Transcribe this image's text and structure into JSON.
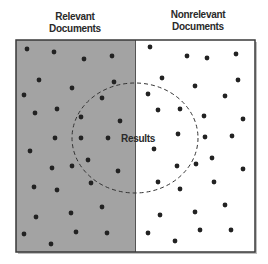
{
  "labels": {
    "relevant": {
      "line1": "Relevant",
      "line2": "Documents"
    },
    "nonrelevant": {
      "line1": "Nonrelevant",
      "line2": "Documents"
    },
    "results": "Results"
  },
  "colors": {
    "relevant_fill": "#a3a3a3",
    "nonrelevant_fill": "#ffffff",
    "border": "#3a3a3a",
    "dot": "#222222",
    "circle_stroke": "#333333"
  },
  "diagram": {
    "box": {
      "x": 16,
      "y": 40,
      "width": 239,
      "height": 212
    },
    "divider_x": 135,
    "results_ellipse": {
      "cx": 135,
      "cy": 138,
      "rx": 63,
      "ry": 55
    },
    "relevant_dots": [
      [
        27,
        49
      ],
      [
        54,
        52
      ],
      [
        84,
        59
      ],
      [
        112,
        56
      ],
      [
        39,
        80
      ],
      [
        72,
        88
      ],
      [
        114,
        82
      ],
      [
        24,
        95
      ],
      [
        102,
        98
      ],
      [
        35,
        113
      ],
      [
        57,
        109
      ],
      [
        81,
        117
      ],
      [
        120,
        121
      ],
      [
        55,
        138
      ],
      [
        81,
        138
      ],
      [
        108,
        138
      ],
      [
        30,
        151
      ],
      [
        88,
        160
      ],
      [
        52,
        168
      ],
      [
        72,
        166
      ],
      [
        118,
        171
      ],
      [
        34,
        187
      ],
      [
        57,
        190
      ],
      [
        91,
        183
      ],
      [
        102,
        207
      ],
      [
        36,
        217
      ],
      [
        71,
        213
      ],
      [
        76,
        232
      ],
      [
        107,
        233
      ],
      [
        24,
        234
      ],
      [
        51,
        244
      ]
    ],
    "nonrelevant_dots": [
      [
        150,
        47
      ],
      [
        187,
        56
      ],
      [
        207,
        58
      ],
      [
        236,
        54
      ],
      [
        162,
        78
      ],
      [
        195,
        86
      ],
      [
        238,
        80
      ],
      [
        148,
        94
      ],
      [
        225,
        96
      ],
      [
        158,
        110
      ],
      [
        180,
        109
      ],
      [
        204,
        116
      ],
      [
        243,
        119
      ],
      [
        178,
        134
      ],
      [
        205,
        137
      ],
      [
        232,
        136
      ],
      [
        154,
        149
      ],
      [
        212,
        158
      ],
      [
        177,
        166
      ],
      [
        196,
        164
      ],
      [
        243,
        169
      ],
      [
        158,
        182
      ],
      [
        180,
        189
      ],
      [
        214,
        182
      ],
      [
        160,
        215
      ],
      [
        195,
        212
      ],
      [
        225,
        205
      ],
      [
        148,
        233
      ],
      [
        200,
        230
      ],
      [
        231,
        230
      ],
      [
        175,
        241
      ]
    ]
  }
}
